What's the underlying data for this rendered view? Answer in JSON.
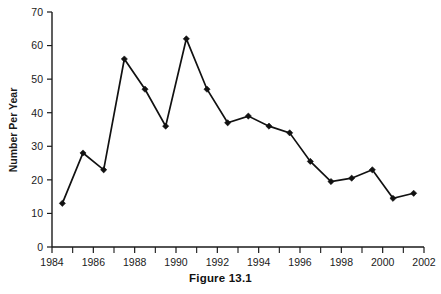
{
  "chart_data": {
    "type": "line",
    "title": "",
    "xlabel": "",
    "ylabel": "Number Per Year",
    "xlim": [
      1984,
      2002
    ],
    "ylim": [
      0,
      70
    ],
    "grid": false,
    "legend": null,
    "marker": "diamond",
    "line_color": "#111111",
    "x": [
      1984.5,
      1985.5,
      1986.5,
      1987.5,
      1988.5,
      1989.5,
      1990.5,
      1991.5,
      1992.5,
      1993.5,
      1994.5,
      1995.5,
      1996.5,
      1997.5,
      1998.5,
      1999.5,
      2000.5,
      2001.5
    ],
    "values": [
      13,
      28,
      23,
      56,
      47,
      36,
      62,
      47,
      37,
      39,
      36,
      34,
      25.5,
      19.5,
      20.5,
      23,
      14.5,
      16
    ],
    "xticks": [
      1984,
      1986,
      1988,
      1990,
      1992,
      1994,
      1996,
      1998,
      2000,
      2002
    ],
    "xtick_labels": [
      "1984",
      "1986",
      "1988",
      "1990",
      "1992",
      "1994",
      "1996",
      "1998",
      "2000",
      "2002"
    ],
    "xminor_ticks": [
      1985,
      1987,
      1989,
      1991,
      1993,
      1995,
      1997,
      1999,
      2001
    ],
    "yticks": [
      0,
      10,
      20,
      30,
      40,
      50,
      60,
      70
    ],
    "ytick_labels": [
      "0",
      "10",
      "20",
      "30",
      "40",
      "50",
      "60",
      "70"
    ]
  },
  "caption": {
    "text": "Figure 13.1"
  }
}
